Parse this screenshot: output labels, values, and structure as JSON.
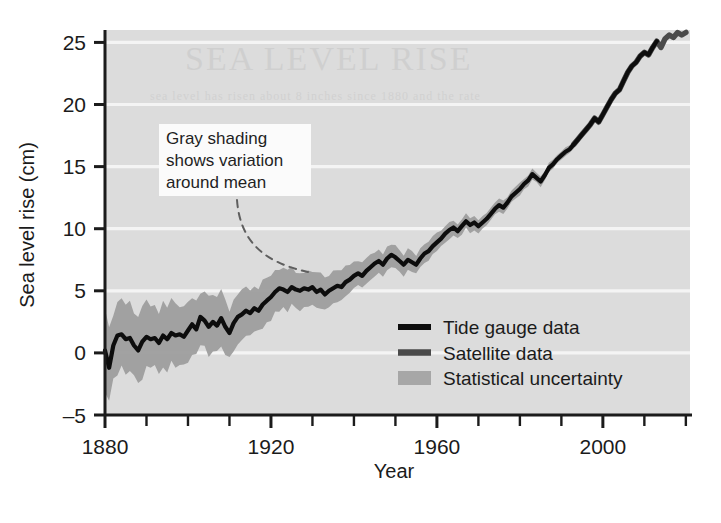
{
  "figure": {
    "background": "#ffffff",
    "plot_background": "#dcdcdc",
    "gridline_color": "#f2f2f2",
    "axis_color": "#1b1b1b"
  },
  "axes": {
    "ylabel": "Sea level rise (cm)",
    "xlabel": "Year",
    "yticks": [
      "25",
      "20",
      "15",
      "10",
      "5",
      "0",
      "–5"
    ],
    "xticks": [
      "1880",
      "1920",
      "1960",
      "2000"
    ]
  },
  "annotation": {
    "line1": "Gray shading",
    "line2": "shows variation",
    "line3": "around mean"
  },
  "legend": {
    "items": [
      {
        "label": "Tide gauge data",
        "type": "line",
        "color": "#0d0d0d"
      },
      {
        "label": "Satellite data",
        "type": "line",
        "color": "#4a4a4a"
      },
      {
        "label": "Statistical uncertainty",
        "type": "swatch",
        "color": "#9d9d9d"
      }
    ]
  },
  "ghost_text": {
    "line1": "SEA LEVEL RISE",
    "line2": "sea level has risen about 8 inches since 1880 and the rate"
  },
  "chart_data": {
    "type": "line",
    "title": "",
    "xlabel": "Year",
    "ylabel": "Sea level rise (cm)",
    "xlim": [
      1880,
      2021
    ],
    "ylim": [
      -5,
      26
    ],
    "yticks": [
      -5,
      0,
      5,
      10,
      15,
      20,
      25
    ],
    "xticks": [
      1880,
      1920,
      1960,
      2000
    ],
    "xtick_minor_step": 10,
    "grid": "horizontal-white-lines",
    "legend_position": "lower-right-inside",
    "annotations": [
      {
        "text": "Gray shading shows variation around mean",
        "x_box": 1890,
        "y_box": 17.5,
        "leader": "dashed curve from text box down-right to uncertainty band near 1925"
      }
    ],
    "series": [
      {
        "name": "Tide gauge data",
        "color": "#0d0d0d",
        "x": [
          1880,
          1881,
          1882,
          1883,
          1884,
          1885,
          1886,
          1887,
          1888,
          1889,
          1890,
          1891,
          1892,
          1893,
          1894,
          1895,
          1896,
          1897,
          1898,
          1899,
          1900,
          1901,
          1902,
          1903,
          1904,
          1905,
          1906,
          1907,
          1908,
          1909,
          1910,
          1911,
          1912,
          1913,
          1914,
          1915,
          1916,
          1917,
          1918,
          1919,
          1920,
          1921,
          1922,
          1923,
          1924,
          1925,
          1926,
          1927,
          1928,
          1929,
          1930,
          1931,
          1932,
          1933,
          1934,
          1935,
          1936,
          1937,
          1938,
          1939,
          1940,
          1941,
          1942,
          1943,
          1944,
          1945,
          1946,
          1947,
          1948,
          1949,
          1950,
          1951,
          1952,
          1953,
          1954,
          1955,
          1956,
          1957,
          1958,
          1959,
          1960,
          1961,
          1962,
          1963,
          1964,
          1965,
          1966,
          1967,
          1968,
          1969,
          1970,
          1971,
          1972,
          1973,
          1974,
          1975,
          1976,
          1977,
          1978,
          1979,
          1980,
          1981,
          1982,
          1983,
          1984,
          1985,
          1986,
          1987,
          1988,
          1989,
          1990,
          1991,
          1992,
          1993,
          1994,
          1995,
          1996,
          1997,
          1998,
          1999,
          2000,
          2001,
          2002,
          2003,
          2004,
          2005,
          2006,
          2007,
          2008,
          2009,
          2010,
          2011,
          2012,
          2013
        ],
        "y": [
          0.2,
          -1.2,
          0.6,
          1.4,
          1.5,
          1.1,
          1.2,
          0.6,
          0.2,
          0.9,
          1.3,
          1.1,
          1.2,
          0.8,
          1.4,
          1.1,
          1.6,
          1.4,
          1.5,
          1.3,
          1.8,
          2.3,
          1.9,
          2.9,
          2.6,
          2.1,
          2.5,
          2.2,
          2.8,
          2.1,
          1.6,
          2.4,
          2.9,
          3.1,
          3.4,
          3.2,
          3.6,
          3.4,
          3.9,
          4.2,
          4.5,
          4.9,
          5.2,
          5.1,
          4.9,
          5.3,
          5.1,
          5.0,
          5.2,
          5.1,
          5.3,
          4.9,
          5.1,
          4.7,
          5.0,
          5.2,
          5.4,
          5.3,
          5.7,
          5.9,
          6.2,
          6.4,
          6.2,
          6.6,
          6.9,
          7.2,
          7.4,
          7.1,
          7.6,
          7.9,
          7.7,
          7.4,
          7.1,
          7.5,
          7.3,
          7.1,
          7.6,
          8.0,
          8.2,
          8.6,
          8.9,
          9.2,
          9.6,
          9.9,
          10.1,
          9.8,
          10.2,
          10.6,
          10.3,
          10.5,
          10.2,
          10.5,
          10.8,
          11.2,
          11.6,
          11.9,
          11.7,
          12.1,
          12.6,
          12.9,
          13.2,
          13.6,
          13.9,
          14.4,
          14.1,
          13.8,
          14.3,
          14.9,
          15.2,
          15.6,
          15.9,
          16.2,
          16.4,
          16.8,
          17.2,
          17.6,
          18.0,
          18.4,
          18.9,
          18.6,
          19.2,
          19.8,
          20.4,
          20.9,
          21.2,
          21.9,
          22.6,
          23.1,
          23.4,
          23.9,
          24.2,
          24.0,
          24.6,
          25.1
        ]
      },
      {
        "name": "Satellite data",
        "color": "#4a4a4a",
        "x": [
          1993,
          1994,
          1995,
          1996,
          1997,
          1998,
          1999,
          2000,
          2001,
          2002,
          2003,
          2004,
          2005,
          2006,
          2007,
          2008,
          2009,
          2010,
          2011,
          2012,
          2013,
          2014,
          2015,
          2016,
          2017,
          2018,
          2019,
          2020
        ],
        "y": [
          16.8,
          17.2,
          17.6,
          18.0,
          18.4,
          18.9,
          18.6,
          19.2,
          19.8,
          20.4,
          20.9,
          21.2,
          21.9,
          22.6,
          23.1,
          23.4,
          23.9,
          24.2,
          24.0,
          24.6,
          25.1,
          24.6,
          25.3,
          25.6,
          25.4,
          25.8,
          25.6,
          25.8
        ]
      }
    ],
    "uncertainty_band": {
      "name": "Statistical uncertainty",
      "color": "#9d9d9d",
      "description": "gray envelope around tide gauge mean, widest (+/- 3 cm) before 1900, narrowing to near zero after 1990",
      "halfwidth_by_year": [
        {
          "year": 1880,
          "halfwidth": 2.9
        },
        {
          "year": 1890,
          "halfwidth": 2.6
        },
        {
          "year": 1900,
          "halfwidth": 2.3
        },
        {
          "year": 1910,
          "halfwidth": 2.0
        },
        {
          "year": 1920,
          "halfwidth": 1.7
        },
        {
          "year": 1930,
          "halfwidth": 1.4
        },
        {
          "year": 1940,
          "halfwidth": 1.1
        },
        {
          "year": 1950,
          "halfwidth": 0.9
        },
        {
          "year": 1960,
          "halfwidth": 0.7
        },
        {
          "year": 1970,
          "halfwidth": 0.55
        },
        {
          "year": 1980,
          "halfwidth": 0.45
        },
        {
          "year": 1990,
          "halfwidth": 0.35
        },
        {
          "year": 2000,
          "halfwidth": 0.25
        },
        {
          "year": 2013,
          "halfwidth": 0.2
        }
      ]
    }
  }
}
